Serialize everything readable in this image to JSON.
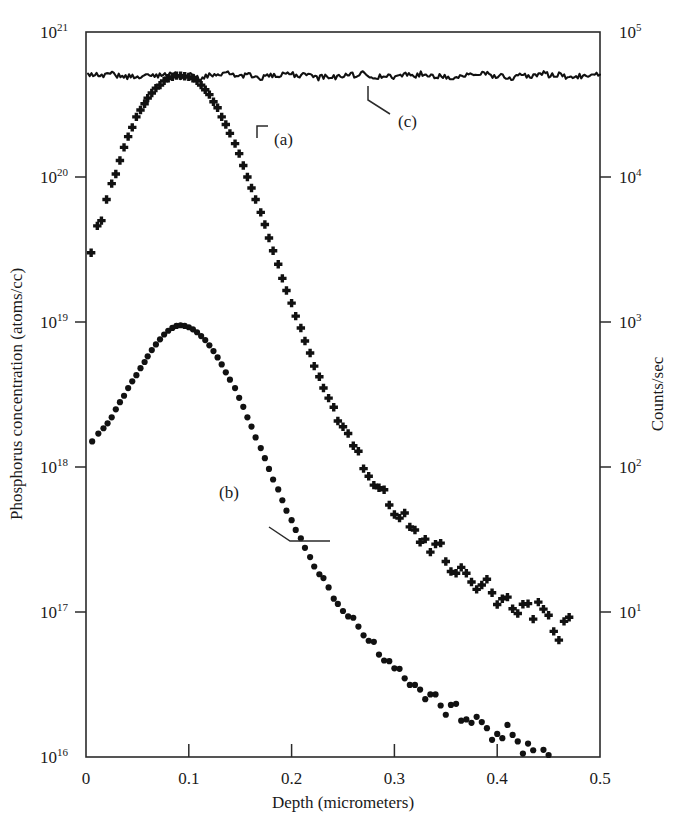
{
  "chart_data": {
    "type": "scatter",
    "title": "",
    "xlabel": "Depth (micrometers)",
    "ylabel": "Phosphorus concentration (atoms/cc)",
    "ylabel_right": "Counts/sec",
    "xlim": [
      0,
      0.5
    ],
    "xticks": [
      0,
      0.1,
      0.2,
      0.3,
      0.4,
      0.5
    ],
    "xtick_labels": [
      "0",
      "0.1",
      "0.2",
      "0.3",
      "0.4",
      "0.5"
    ],
    "ylim": [
      1e+16,
      1e+21
    ],
    "yscale": "log",
    "yticks_exponents": [
      16,
      17,
      18,
      19,
      20,
      21
    ],
    "ytick_labels": [
      "10^16",
      "10^17",
      "10^18",
      "10^19",
      "10^20",
      "10^21"
    ],
    "ytick_mantissa": "10",
    "ytick_sups": [
      "16",
      "17",
      "18",
      "19",
      "20",
      "21"
    ],
    "ylim_right": [
      1,
      100000
    ],
    "yscale_right": "log",
    "yticks_right_exponents": [
      1,
      2,
      3,
      4,
      5
    ],
    "ytick_right_labels": [
      "10^1",
      "10^2",
      "10^3",
      "10^4",
      "10^5"
    ],
    "ytick_right_sups": [
      "1",
      "2",
      "3",
      "4",
      "5"
    ],
    "grid": false,
    "legend_position": "inline-annotations",
    "annotations": [
      {
        "label": "(a)",
        "x": 0.237,
        "y_concentration": 2e+20,
        "marker": "plus"
      },
      {
        "label": "(b)",
        "x": 0.158,
        "y_concentration": 3e+17,
        "marker": "dot"
      },
      {
        "label": "(c)",
        "x": 0.317,
        "y_concentration": 2.2e+20,
        "marker": "line"
      }
    ],
    "series": [
      {
        "name": "(a)",
        "marker": "plus",
        "description": "Phosphorus SIMS profile, peak near 5e20 at 0.09 um",
        "points": [
          [
            0.005,
            3e+19
          ],
          [
            0.011,
            4.6e+19
          ],
          [
            0.015,
            5e+19
          ],
          [
            0.02,
            7e+19
          ],
          [
            0.025,
            9e+19
          ],
          [
            0.029,
            1.05e+20
          ],
          [
            0.033,
            1.3e+20
          ],
          [
            0.037,
            1.6e+20
          ],
          [
            0.041,
            1.9e+20
          ],
          [
            0.045,
            2.2e+20
          ],
          [
            0.049,
            2.6e+20
          ],
          [
            0.053,
            2.9e+20
          ],
          [
            0.057,
            3.2e+20
          ],
          [
            0.06,
            3.5e+20
          ],
          [
            0.064,
            3.8e+20
          ],
          [
            0.068,
            4.1e+20
          ],
          [
            0.072,
            4.3e+20
          ],
          [
            0.076,
            4.6e+20
          ],
          [
            0.08,
            4.8e+20
          ],
          [
            0.084,
            4.9e+20
          ],
          [
            0.088,
            5e+20
          ],
          [
            0.092,
            5e+20
          ],
          [
            0.096,
            4.95e+20
          ],
          [
            0.1,
            4.9e+20
          ],
          [
            0.104,
            4.8e+20
          ],
          [
            0.108,
            4.6e+20
          ],
          [
            0.112,
            4.3e+20
          ],
          [
            0.116,
            4e+20
          ],
          [
            0.12,
            3.7e+20
          ],
          [
            0.124,
            3.3e+20
          ],
          [
            0.128,
            3e+20
          ],
          [
            0.132,
            2.6e+20
          ],
          [
            0.136,
            2.3e+20
          ],
          [
            0.14,
            2e+20
          ],
          [
            0.145,
            1.7e+20
          ],
          [
            0.149,
            1.45e+20
          ],
          [
            0.153,
            1.2e+20
          ],
          [
            0.157,
            1e+20
          ],
          [
            0.161,
            8.4e+19
          ],
          [
            0.165,
            7e+19
          ],
          [
            0.17,
            5.7e+19
          ],
          [
            0.174,
            4.7e+19
          ],
          [
            0.178,
            3.8e+19
          ],
          [
            0.182,
            3.1e+19
          ],
          [
            0.187,
            2.5e+19
          ],
          [
            0.191,
            2e+19
          ],
          [
            0.195,
            1.65e+19
          ],
          [
            0.2,
            1.35e+19
          ],
          [
            0.204,
            1.1e+19
          ],
          [
            0.209,
            9e+18
          ],
          [
            0.213,
            7.4e+18
          ],
          [
            0.218,
            6.1e+18
          ],
          [
            0.222,
            5e+18
          ],
          [
            0.227,
            4.2e+18
          ],
          [
            0.231,
            3.5e+18
          ],
          [
            0.236,
            3e+18
          ],
          [
            0.241,
            2.5e+18
          ],
          [
            0.245,
            2.15e+18
          ],
          [
            0.25,
            1.85e+18
          ],
          [
            0.255,
            1.6e+18
          ],
          [
            0.26,
            1.4e+18
          ],
          [
            0.265,
            1.2e+18
          ],
          [
            0.27,
            1.05e+18
          ],
          [
            0.275,
            9.2e+17
          ],
          [
            0.28,
            8.2e+17
          ],
          [
            0.285,
            7.3e+17
          ],
          [
            0.29,
            6.5e+17
          ],
          [
            0.295,
            5.9e+17
          ],
          [
            0.3,
            5.3e+17
          ],
          [
            0.305,
            4.8e+17
          ],
          [
            0.31,
            4.4e+17
          ],
          [
            0.315,
            4e+17
          ],
          [
            0.32,
            3.7e+17
          ],
          [
            0.325,
            3.4e+17
          ],
          [
            0.33,
            3.1e+17
          ],
          [
            0.335,
            2.9e+17
          ],
          [
            0.34,
            2.7e+17
          ],
          [
            0.345,
            2.5e+17
          ],
          [
            0.35,
            2.35e+17
          ],
          [
            0.355,
            2.2e+17
          ],
          [
            0.36,
            2.1e+17
          ],
          [
            0.365,
            1.95e+17
          ],
          [
            0.37,
            1.85e+17
          ],
          [
            0.375,
            1.75e+17
          ],
          [
            0.38,
            1.65e+17
          ],
          [
            0.385,
            1.55e+17
          ],
          [
            0.39,
            1.5e+17
          ],
          [
            0.395,
            1.4e+17
          ],
          [
            0.4,
            1.35e+17
          ],
          [
            0.405,
            1.3e+17
          ],
          [
            0.41,
            1.25e+17
          ],
          [
            0.415,
            1.2e+17
          ],
          [
            0.42,
            1.15e+17
          ],
          [
            0.425,
            1.1e+17
          ],
          [
            0.43,
            1.05e+17
          ],
          [
            0.435,
            1e+17
          ],
          [
            0.44,
            9.8e+16
          ],
          [
            0.445,
            9.4e+16
          ],
          [
            0.45,
            9e+16
          ],
          [
            0.455,
            8.7e+16
          ],
          [
            0.46,
            8.4e+16
          ],
          [
            0.465,
            8.2e+16
          ],
          [
            0.47,
            8e+16
          ]
        ]
      },
      {
        "name": "(b)",
        "marker": "dot",
        "description": "Phosphorus SIMS profile, peak near 9.5e18 at 0.09 um",
        "points": [
          [
            0.006,
            1.5e+18
          ],
          [
            0.012,
            1.7e+18
          ],
          [
            0.017,
            1.85e+18
          ],
          [
            0.021,
            2e+18
          ],
          [
            0.025,
            2.2e+18
          ],
          [
            0.029,
            2.5e+18
          ],
          [
            0.033,
            2.8e+18
          ],
          [
            0.037,
            3.1e+18
          ],
          [
            0.041,
            3.5e+18
          ],
          [
            0.045,
            3.9e+18
          ],
          [
            0.049,
            4.3e+18
          ],
          [
            0.053,
            4.8e+18
          ],
          [
            0.057,
            5.3e+18
          ],
          [
            0.06,
            5.8e+18
          ],
          [
            0.064,
            6.4e+18
          ],
          [
            0.068,
            7e+18
          ],
          [
            0.072,
            7.6e+18
          ],
          [
            0.076,
            8.2e+18
          ],
          [
            0.08,
            8.7e+18
          ],
          [
            0.084,
            9.1e+18
          ],
          [
            0.088,
            9.4e+18
          ],
          [
            0.092,
            9.5e+18
          ],
          [
            0.096,
            9.4e+18
          ],
          [
            0.1,
            9.2e+18
          ],
          [
            0.104,
            8.9e+18
          ],
          [
            0.108,
            8.5e+18
          ],
          [
            0.112,
            8e+18
          ],
          [
            0.116,
            7.5e+18
          ],
          [
            0.12,
            6.9e+18
          ],
          [
            0.124,
            6.3e+18
          ],
          [
            0.128,
            5.7e+18
          ],
          [
            0.132,
            5.1e+18
          ],
          [
            0.136,
            4.5e+18
          ],
          [
            0.14,
            4e+18
          ],
          [
            0.145,
            3.5e+18
          ],
          [
            0.149,
            3e+18
          ],
          [
            0.153,
            2.6e+18
          ],
          [
            0.157,
            2.2e+18
          ],
          [
            0.161,
            1.9e+18
          ],
          [
            0.165,
            1.6e+18
          ],
          [
            0.17,
            1.35e+18
          ],
          [
            0.174,
            1.15e+18
          ],
          [
            0.178,
            9.7e+17
          ],
          [
            0.182,
            8.2e+17
          ],
          [
            0.187,
            7e+17
          ],
          [
            0.191,
            5.9e+17
          ],
          [
            0.195,
            5e+17
          ],
          [
            0.2,
            4.3e+17
          ],
          [
            0.204,
            3.7e+17
          ],
          [
            0.209,
            3.2e+17
          ],
          [
            0.213,
            2.8e+17
          ],
          [
            0.218,
            2.4e+17
          ],
          [
            0.222,
            2.1e+17
          ],
          [
            0.227,
            1.85e+17
          ],
          [
            0.231,
            1.65e+17
          ],
          [
            0.236,
            1.45e+17
          ],
          [
            0.241,
            1.3e+17
          ],
          [
            0.245,
            1.17e+17
          ],
          [
            0.25,
            1.05e+17
          ],
          [
            0.255,
            9.5e+16
          ],
          [
            0.26,
            8.6e+16
          ],
          [
            0.265,
            7.8e+16
          ],
          [
            0.27,
            7.1e+16
          ],
          [
            0.275,
            6.5e+16
          ],
          [
            0.28,
            6e+16
          ],
          [
            0.285,
            5.5e+16
          ],
          [
            0.29,
            5.1e+16
          ],
          [
            0.295,
            4.7e+16
          ],
          [
            0.3,
            4.4e+16
          ],
          [
            0.305,
            4.1e+16
          ],
          [
            0.31,
            3.8e+16
          ],
          [
            0.315,
            3.6e+16
          ],
          [
            0.32,
            3.3e+16
          ],
          [
            0.325,
            3.1e+16
          ],
          [
            0.33,
            2.95e+16
          ],
          [
            0.335,
            2.8e+16
          ],
          [
            0.34,
            2.6e+16
          ],
          [
            0.345,
            2.5e+16
          ],
          [
            0.35,
            2.35e+16
          ],
          [
            0.355,
            2.2e+16
          ],
          [
            0.36,
            2.1e+16
          ],
          [
            0.365,
            2e+16
          ],
          [
            0.37,
            1.9e+16
          ],
          [
            0.375,
            1.8e+16
          ],
          [
            0.38,
            1.72e+16
          ],
          [
            0.385,
            1.65e+16
          ],
          [
            0.39,
            1.58e+16
          ],
          [
            0.395,
            1.5e+16
          ],
          [
            0.4,
            1.45e+16
          ],
          [
            0.405,
            1.4e+16
          ],
          [
            0.41,
            1.35e+16
          ],
          [
            0.415,
            1.3e+16
          ],
          [
            0.42,
            1.26e+16
          ],
          [
            0.425,
            1.22e+16
          ],
          [
            0.43,
            1.18e+16
          ],
          [
            0.435,
            1.15e+16
          ],
          [
            0.44,
            1.12e+16
          ],
          [
            0.445,
            1.09e+16
          ],
          [
            0.45,
            1.06e+16
          ],
          [
            0.455,
            1.04e+16
          ],
          [
            0.46,
            1.02e+16
          ]
        ]
      },
      {
        "name": "(c)",
        "marker": "line",
        "description": "Flat noisy reference trace near 5e20 across full depth range",
        "points": [
          [
            0.002,
            5e+20
          ],
          [
            0.5,
            5e+20
          ]
        ],
        "level": 5e+20,
        "noise_amplitude": 0.02
      }
    ]
  }
}
